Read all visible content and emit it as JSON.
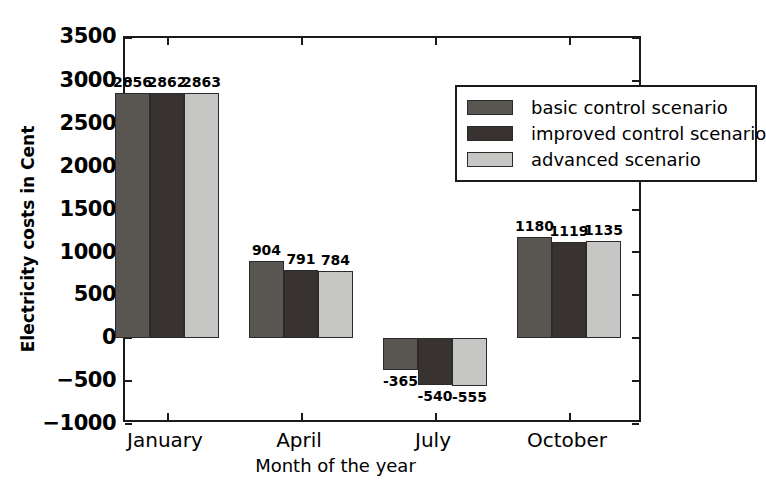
{
  "chart_data": {
    "type": "bar",
    "title": "",
    "xlabel": "Month of the year",
    "ylabel": "Electricity costs in Cent",
    "categories": [
      "January",
      "April",
      "July",
      "October"
    ],
    "series": [
      {
        "name": "basic control scenario",
        "color": "#595651",
        "values": [
          2856,
          904,
          -365,
          1180
        ]
      },
      {
        "name": "improved control scenario",
        "color": "#383330",
        "values": [
          2862,
          791,
          -540,
          1119
        ]
      },
      {
        "name": "advanced scenario",
        "color": "#c6c6c4",
        "values": [
          2863,
          784,
          -555,
          1135
        ]
      }
    ],
    "ylim": [
      -1000,
      3500
    ],
    "yticks": [
      -1000,
      -500,
      0,
      500,
      1000,
      1500,
      2000,
      2500,
      3000,
      3500
    ],
    "ytick_labels": [
      "−1000",
      "−500",
      "0",
      "500",
      "1000",
      "1500",
      "2000",
      "2500",
      "3000",
      "3500"
    ],
    "grid": false,
    "legend_position": "upper right",
    "bar_value_labels": [
      [
        "2856",
        "2862",
        "2863"
      ],
      [
        "904",
        "791",
        "784"
      ],
      [
        "-365",
        "-540",
        "-555"
      ],
      [
        "1180",
        "1119",
        "1135"
      ]
    ]
  },
  "axis": {
    "y_label": "Electricity costs in Cent",
    "x_label": "Month of the year",
    "y_tick_0": "−1000",
    "y_tick_1": "−500",
    "y_tick_2": "0",
    "y_tick_3": "500",
    "y_tick_4": "1000",
    "y_tick_5": "1500",
    "y_tick_6": "2000",
    "y_tick_7": "2500",
    "y_tick_8": "3000",
    "y_tick_9": "3500",
    "x_tick_0": "January",
    "x_tick_1": "April",
    "x_tick_2": "July",
    "x_tick_3": "October"
  },
  "legend": {
    "items": [
      {
        "label": "basic control scenario",
        "color": "#595651"
      },
      {
        "label": "improved control scenario",
        "color": "#383330"
      },
      {
        "label": "advanced scenario",
        "color": "#c6c6c4"
      }
    ]
  }
}
